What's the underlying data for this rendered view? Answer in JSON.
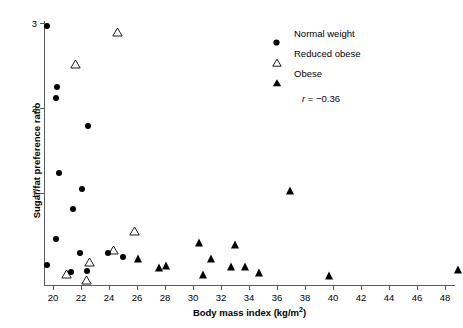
{
  "chart_data": {
    "type": "scatter",
    "title": "",
    "xlabel": "Body mass index (kg/m2)",
    "ylabel": "Sugar/fat preference ratio",
    "xlim": [
      19.0,
      50.5
    ],
    "ylim": [
      0.0,
      3.05
    ],
    "xticks": [
      20,
      22,
      24,
      26,
      28,
      30,
      32,
      34,
      36,
      38,
      40,
      42,
      44,
      46,
      48,
      50
    ],
    "yticks": [
      1,
      2,
      3
    ],
    "grid": false,
    "annotations": [
      "r = −0.36"
    ],
    "correlation_r": "-0.36",
    "legend_position": "top-right",
    "series": [
      {
        "name": "Normal weight",
        "marker": "filled-circle",
        "color": "#000000",
        "points": [
          [
            19.6,
            2.96
          ],
          [
            20.3,
            2.25
          ],
          [
            20.2,
            2.12
          ],
          [
            22.5,
            1.79
          ],
          [
            20.4,
            1.24
          ],
          [
            22.1,
            1.05
          ],
          [
            21.4,
            0.81
          ],
          [
            20.2,
            0.46
          ],
          [
            21.9,
            0.3
          ],
          [
            19.6,
            0.15
          ],
          [
            21.3,
            0.07
          ],
          [
            22.4,
            0.08
          ],
          [
            25.0,
            0.25
          ],
          [
            23.9,
            0.3
          ]
        ]
      },
      {
        "name": "Reduced obese",
        "marker": "open-triangle",
        "color": "#000000",
        "points": [
          [
            24.2,
            3.0
          ],
          [
            21.2,
            2.62
          ],
          [
            25.4,
            0.66
          ],
          [
            23.9,
            0.44
          ],
          [
            22.2,
            0.3
          ],
          [
            20.6,
            0.15
          ],
          [
            22.0,
            0.08
          ]
        ]
      },
      {
        "name": "Obese",
        "marker": "filled-triangle",
        "color": "#000000",
        "points": [
          [
            36.9,
            1.02
          ],
          [
            30.4,
            0.41
          ],
          [
            33.0,
            0.39
          ],
          [
            31.3,
            0.22
          ],
          [
            26.1,
            0.22
          ],
          [
            32.7,
            0.13
          ],
          [
            27.6,
            0.12
          ],
          [
            33.7,
            0.13
          ],
          [
            34.7,
            0.06
          ],
          [
            30.7,
            0.03
          ],
          [
            39.7,
            0.02
          ],
          [
            48.9,
            0.09
          ],
          [
            28.1,
            0.14
          ]
        ]
      }
    ]
  },
  "axes": {
    "x_title": "Body mass index (kg/m",
    "x_title_sup": "2",
    "x_title_tail": ")",
    "y_title": "Sugar/fat preference ratio",
    "x_tick_labels": [
      "20",
      "22",
      "24",
      "26",
      "28",
      "30",
      "32",
      "34",
      "36",
      "38",
      "40",
      "42",
      "44",
      "46",
      "48",
      "50"
    ],
    "y_tick_labels": [
      "1",
      "2",
      "3"
    ]
  },
  "legend": {
    "entries": [
      {
        "symbol": "filled-circle-icon",
        "label": "Normal weight"
      },
      {
        "symbol": "open-triangle-icon",
        "label": "Reduced obese"
      },
      {
        "symbol": "filled-triangle-icon",
        "label": "Obese"
      }
    ],
    "stat_prefix": "r",
    "stat_value": "= −0.36"
  }
}
